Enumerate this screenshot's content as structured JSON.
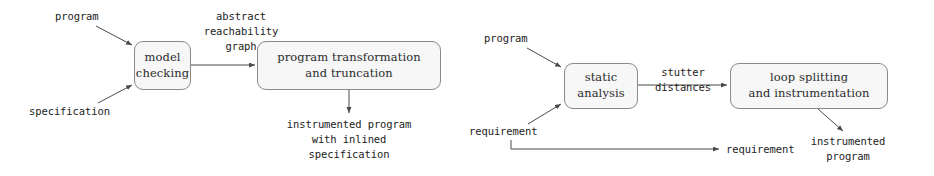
{
  "figure": {
    "background_color": "#ffffff",
    "box_fill_color": "#f7f7f7",
    "box_border_color": "#8a8a8a",
    "text_color": "#232323"
  },
  "left_diagram": {
    "inputs": {
      "program": "program",
      "specification": "specification"
    },
    "boxes": {
      "model_checking": {
        "line1": "model",
        "line2": "checking"
      },
      "program_transformation": {
        "line1": "program transformation",
        "line2": "and truncation"
      }
    },
    "edge_label": {
      "line1": "abstract",
      "line2": "reachability",
      "line3": "graph"
    },
    "output": {
      "line1": "instrumented program",
      "line2": "with inlined",
      "line3": "specification"
    }
  },
  "right_diagram": {
    "inputs": {
      "program": "program",
      "requirement": "requirement"
    },
    "boxes": {
      "static_analysis": {
        "line1": "static",
        "line2": "analysis"
      },
      "loop_splitting": {
        "line1": "loop splitting",
        "line2": "and instrumentation"
      }
    },
    "edge_label": {
      "line1": "stutter",
      "line2": "distances"
    },
    "outputs": {
      "requirement": "requirement",
      "instrumented_program": {
        "line1": "instrumented",
        "line2": "program"
      }
    }
  }
}
